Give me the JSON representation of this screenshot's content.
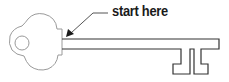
{
  "diagram": {
    "annotation": {
      "label": "start here",
      "arrow_target": "shaft-start"
    },
    "colors": {
      "outline_light": "#9a9a9a",
      "outline_dark": "#333333",
      "text": "#1a1a1a"
    }
  }
}
